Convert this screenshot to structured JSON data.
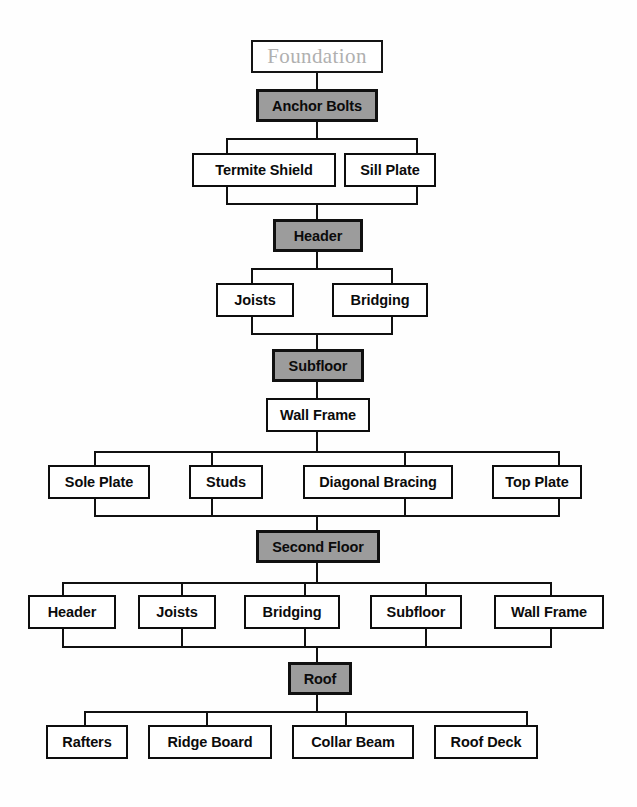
{
  "diagram": {
    "colors": {
      "gray_fill": "#9c9c9c",
      "box_fill": "#ffffff",
      "line": "#101010",
      "title_text": "#b0b0b0",
      "text": "#0b0b0b",
      "background": "#fefefe"
    },
    "levels": [
      {
        "kind": "title",
        "nodes": [
          {
            "label": "Foundation"
          }
        ]
      },
      {
        "kind": "milestone",
        "nodes": [
          {
            "label": "Anchor Bolts"
          }
        ]
      },
      {
        "kind": "components",
        "nodes": [
          {
            "label": "Termite Shield"
          },
          {
            "label": "Sill Plate"
          }
        ]
      },
      {
        "kind": "milestone",
        "nodes": [
          {
            "label": "Header"
          }
        ]
      },
      {
        "kind": "components",
        "nodes": [
          {
            "label": "Joists"
          },
          {
            "label": "Bridging"
          }
        ]
      },
      {
        "kind": "milestone",
        "nodes": [
          {
            "label": "Subfloor"
          }
        ]
      },
      {
        "kind": "components",
        "nodes": [
          {
            "label": "Wall Frame"
          }
        ]
      },
      {
        "kind": "components",
        "nodes": [
          {
            "label": "Sole Plate"
          },
          {
            "label": "Studs"
          },
          {
            "label": "Diagonal Bracing"
          },
          {
            "label": "Top Plate"
          }
        ]
      },
      {
        "kind": "milestone",
        "nodes": [
          {
            "label": "Second Floor"
          }
        ]
      },
      {
        "kind": "components",
        "nodes": [
          {
            "label": "Header"
          },
          {
            "label": "Joists"
          },
          {
            "label": "Bridging"
          },
          {
            "label": "Subfloor"
          },
          {
            "label": "Wall Frame"
          }
        ]
      },
      {
        "kind": "milestone",
        "nodes": [
          {
            "label": "Roof"
          }
        ]
      },
      {
        "kind": "components",
        "nodes": [
          {
            "label": "Rafters"
          },
          {
            "label": "Ridge Board"
          },
          {
            "label": "Collar Beam"
          },
          {
            "label": "Roof Deck"
          }
        ]
      }
    ]
  }
}
